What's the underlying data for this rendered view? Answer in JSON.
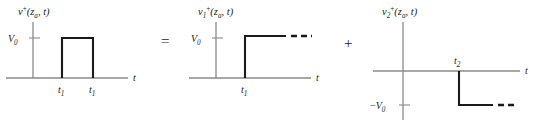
{
  "figure": {
    "caption_type": "waveform-decomposition-diagram",
    "operators": [
      {
        "symbol": "=",
        "x": 163,
        "y": 36
      },
      {
        "symbol": "+",
        "x": 346,
        "y": 38
      }
    ]
  },
  "plots": [
    {
      "id": "pulse",
      "title": {
        "base": "v",
        "superscript": "+",
        "arg_open": "(",
        "arg_var": "z",
        "arg_sub": "a",
        "arg_sep": ", ",
        "arg_time": "t",
        "arg_close": ")"
      },
      "y_axis_label": {
        "base": "V",
        "sub": "0"
      },
      "x_axis_label": "t",
      "x_ticks": [
        {
          "label_base": "t",
          "label_sub": "1"
        },
        {
          "label_base": "t",
          "label_sub": "1"
        }
      ],
      "waveform": "rectangular-pulse",
      "amplitude": "V0",
      "dashed_continuation": false
    },
    {
      "id": "step-rising",
      "title": {
        "base": "v",
        "base_sub": "1",
        "superscript": "+",
        "arg_open": "(",
        "arg_var": "z",
        "arg_sub": "a",
        "arg_sep": ", ",
        "arg_time": "t",
        "arg_close": ")"
      },
      "y_axis_label": {
        "base": "V",
        "sub": "0"
      },
      "x_axis_label": "t",
      "x_ticks": [
        {
          "label_base": "t",
          "label_sub": "1"
        }
      ],
      "waveform": "positive-step",
      "amplitude": "V0",
      "dashed_continuation": true,
      "dash_count": 3
    },
    {
      "id": "step-falling",
      "title": {
        "base": "v",
        "base_sub": "2",
        "superscript": "+",
        "arg_open": "(",
        "arg_var": "z",
        "arg_sub": "a",
        "arg_sep": ", ",
        "arg_time": "t",
        "arg_close": ")"
      },
      "y_axis_label": {
        "prefix": "−",
        "base": "V",
        "sub": "0"
      },
      "x_axis_label": "t",
      "x_ticks": [
        {
          "label_base": "t",
          "label_sub": "2"
        }
      ],
      "waveform": "negative-step",
      "amplitude": "-V0",
      "dashed_continuation": true,
      "dash_count": 2
    }
  ],
  "colors": {
    "axis": "#8a8a8a",
    "curve": "#1a1a1a",
    "text": "#1a1a1a",
    "background": "#ffffff"
  }
}
